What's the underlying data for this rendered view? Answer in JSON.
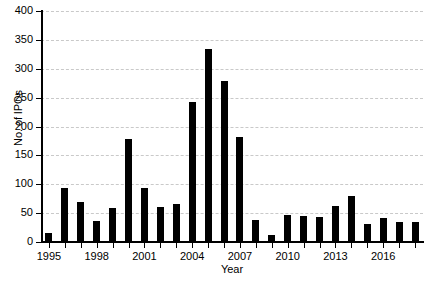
{
  "chart_data": {
    "type": "bar",
    "title": "",
    "xlabel": "Year",
    "ylabel": "No. of IPOs",
    "categories": [
      "1995",
      "1996",
      "1997",
      "1998",
      "1999",
      "2000",
      "2001",
      "2002",
      "2003",
      "2004",
      "2005",
      "2006",
      "2007",
      "2008",
      "2009",
      "2010",
      "2011",
      "2012",
      "2013",
      "2014",
      "2015",
      "2016",
      "2017",
      "2018"
    ],
    "values": [
      16,
      94,
      70,
      37,
      59,
      179,
      94,
      60,
      66,
      243,
      335,
      278,
      181,
      38,
      13,
      47,
      45,
      43,
      62,
      79,
      32,
      42,
      35,
      35
    ],
    "ylim": [
      0,
      400
    ],
    "yticks": [
      0,
      50,
      100,
      150,
      200,
      250,
      300,
      350,
      400
    ],
    "ytick_labels": [
      "0",
      "50",
      "100",
      "150",
      "200",
      "250",
      "300",
      "350",
      "400"
    ],
    "xtick_labels": [
      "1995",
      "1998",
      "2001",
      "2004",
      "2007",
      "2010",
      "2013",
      "2016"
    ],
    "xtick_categories": [
      "1995",
      "1998",
      "2001",
      "2004",
      "2007",
      "2010",
      "2013",
      "2016"
    ],
    "grid": true,
    "grid_axis": "y",
    "grid_style": "dashed",
    "legend": null,
    "bar_color": "#000000",
    "grid_color": "#c9c9c9",
    "axis_color": "#000000",
    "background_color": "#ffffff"
  },
  "axes": {
    "y_title": "No. of IPOs",
    "x_title": "Year"
  }
}
